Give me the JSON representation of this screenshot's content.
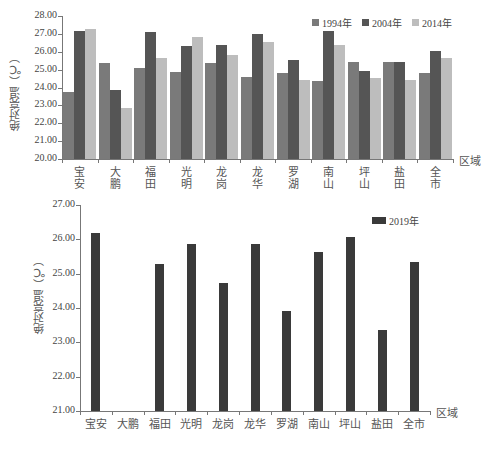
{
  "chart_data": [
    {
      "type": "bar",
      "title": "",
      "xlabel": "区域",
      "ylabel": "绝对亮温（℃）",
      "ylim": [
        20.0,
        28.0
      ],
      "yticks": [
        "20.00",
        "21.00",
        "22.00",
        "23.00",
        "24.00",
        "25.00",
        "26.00",
        "27.00",
        "28.00"
      ],
      "grid": false,
      "legend_position": "top-right",
      "categories": [
        "宝安",
        "大鹏",
        "福田",
        "光明",
        "龙岗",
        "龙华",
        "罗湖",
        "南山",
        "坪山",
        "盐田",
        "全市"
      ],
      "series": [
        {
          "name": "1994年",
          "color": "#7a7a7a",
          "values": [
            23.75,
            25.35,
            25.1,
            24.85,
            25.35,
            24.6,
            24.8,
            24.35,
            25.45,
            25.4,
            24.8
          ]
        },
        {
          "name": "2004年",
          "color": "#555555",
          "values": [
            27.15,
            23.85,
            27.1,
            26.3,
            26.35,
            27.0,
            25.55,
            27.15,
            24.95,
            25.4,
            26.05
          ]
        },
        {
          "name": "2014年",
          "color": "#bdbdbd",
          "values": [
            27.3,
            22.85,
            25.65,
            26.8,
            25.8,
            26.55,
            24.4,
            26.4,
            24.55,
            24.4,
            25.65
          ]
        }
      ]
    },
    {
      "type": "bar",
      "title": "",
      "xlabel": "区域",
      "ylabel": "绝对亮温（℃）",
      "ylim": [
        21.0,
        27.0
      ],
      "yticks": [
        "21.00",
        "22.00",
        "23.00",
        "24.00",
        "25.00",
        "26.00",
        "27.00"
      ],
      "grid": false,
      "legend_position": "top-right",
      "categories": [
        "宝安",
        "大鹏",
        "福田",
        "光明",
        "龙岗",
        "龙华",
        "罗湖",
        "南山",
        "坪山",
        "盐田",
        "全市"
      ],
      "series": [
        {
          "name": "2019年",
          "color": "#3a3a3a",
          "values": [
            26.18,
            null,
            25.28,
            25.85,
            24.72,
            25.85,
            23.92,
            25.62,
            26.08,
            23.35,
            25.33
          ]
        }
      ]
    }
  ]
}
